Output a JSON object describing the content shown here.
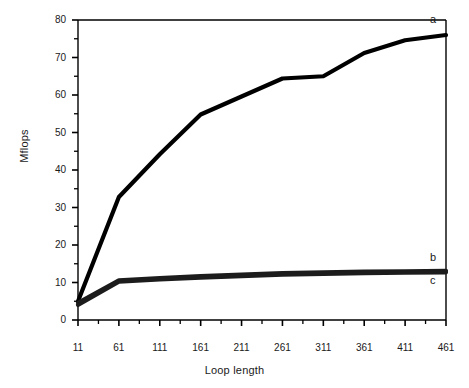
{
  "chart_data": {
    "type": "line",
    "title": "",
    "xlabel": "Loop length",
    "ylabel": "Mflops",
    "xlim": [
      11,
      461
    ],
    "ylim": [
      0,
      80
    ],
    "grid": false,
    "legend_position": "inline-right",
    "x_tick_labels": [
      "11",
      "61",
      "111",
      "161",
      "211",
      "261",
      "311",
      "361",
      "411",
      "461"
    ],
    "x_tick_values": [
      11,
      61,
      111,
      161,
      211,
      261,
      311,
      361,
      411,
      461
    ],
    "x_minor_tick_step": 25,
    "y_tick_labels": [
      "0",
      "10",
      "20",
      "30",
      "40",
      "50",
      "60",
      "70",
      "80"
    ],
    "y_tick_values": [
      0,
      10,
      20,
      30,
      40,
      50,
      60,
      70,
      80
    ],
    "y_minor_tick_step": 5,
    "x": [
      11,
      61,
      111,
      161,
      211,
      261,
      311,
      361,
      411,
      461
    ],
    "series": [
      {
        "name": "a",
        "label": "a",
        "color": "#000000",
        "values": [
          5.0,
          32.8,
          44.2,
          54.8,
          59.6,
          64.4,
          65.0,
          71.2,
          74.6,
          76.0
        ]
      },
      {
        "name": "b",
        "label": "b",
        "color": "#1c1c1c",
        "values": [
          4.6,
          10.6,
          11.2,
          11.7,
          12.1,
          12.5,
          12.7,
          12.9,
          13.0,
          13.1
        ]
      },
      {
        "name": "c",
        "label": "c",
        "color": "#1c1c1c",
        "values": [
          4.0,
          10.2,
          10.8,
          11.3,
          11.7,
          12.1,
          12.3,
          12.5,
          12.6,
          12.7
        ]
      }
    ],
    "axis_color": "#000000",
    "background_color": "#ffffff"
  },
  "axis": {
    "y_title": "Mflops",
    "x_title": "Loop length"
  },
  "labels": {
    "a": "a",
    "b": "b",
    "c": "c"
  }
}
